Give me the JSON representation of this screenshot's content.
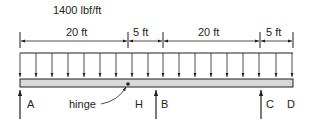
{
  "diagram": {
    "load_label": "1400 lbf/ft",
    "dimensions": [
      {
        "label": "20 ft",
        "x1": 20,
        "x2": 128
      },
      {
        "label": "5 ft",
        "x1": 128,
        "x2": 163
      },
      {
        "label": "20 ft",
        "x1": 163,
        "x2": 260
      },
      {
        "label": "5 ft",
        "x1": 260,
        "x2": 293
      }
    ],
    "supports": [
      {
        "label": "A",
        "x": 20
      },
      {
        "label": "B",
        "x": 163
      },
      {
        "label": "C",
        "x": 260
      }
    ],
    "points": [
      {
        "label": "H",
        "x": 139
      },
      {
        "label": "D",
        "x": 292
      }
    ],
    "hinge": {
      "label": "hinge",
      "x": 128
    },
    "colors": {
      "ink": "#231f20",
      "beam_fill": "#d9d9d9"
    }
  }
}
